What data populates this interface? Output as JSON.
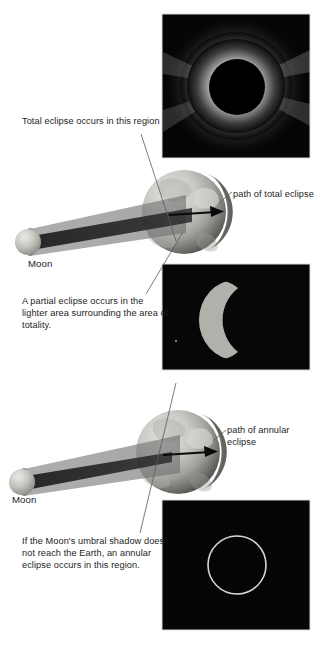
{
  "figure": {
    "background_color": "#ffffff",
    "text_color": "#1d1d1d",
    "width": 319,
    "height": 645
  },
  "captions": {
    "total_region": "Total eclipse occurs in this region",
    "partial_region": "A partial eclipse occurs in the lighter area surrounding the area of totality.",
    "annular_region": "If the Moon's umbral shadow does not reach the Earth, an annular eclipse occurs in this region.",
    "path_of_total": "path of total eclipse",
    "path_of_annular": "path of annular eclipse"
  },
  "labels": {
    "moon_top": "Moon",
    "moon_bottom": "Moon"
  },
  "photos": [
    {
      "name": "total-eclipse-corona-photo",
      "alt": "Total solar eclipse showing the white corona around a black lunar disk",
      "x": 162,
      "y": 14,
      "width": 148,
      "height": 144,
      "background_color": "#060606",
      "corona_color": "#f4f4f4",
      "disk_color": "#000000"
    },
    {
      "name": "partial-eclipse-photo",
      "alt": "Partial solar eclipse showing a bright crescent of the Sun",
      "x": 162,
      "y": 264,
      "width": 148,
      "height": 106,
      "background_color": "#070707",
      "crescent_color": "#b9b9b4"
    },
    {
      "name": "annular-eclipse-photo",
      "alt": "Annular solar eclipse showing a thin ring of fire",
      "x": 162,
      "y": 500,
      "width": 148,
      "height": 130,
      "background_color": "#050505",
      "ring_color": "#cfcfc8"
    }
  ],
  "diagrams": [
    {
      "name": "total-eclipse-diagram",
      "earth": {
        "cx": 184,
        "cy": 212,
        "r": 42
      },
      "moon": {
        "cx": 28,
        "cy": 242,
        "r": 13
      },
      "umbra_color": "#2b2b2b",
      "penumbra_color": "#9a9a9a",
      "arrow_label": "path of total eclipse",
      "shadow_reaches_earth": true
    },
    {
      "name": "annular-eclipse-diagram",
      "earth": {
        "cx": 178,
        "cy": 452,
        "r": 42
      },
      "moon": {
        "cx": 22,
        "cy": 482,
        "r": 13
      },
      "umbra_color": "#2b2b2b",
      "penumbra_color": "#9a9a9a",
      "arrow_label": "path of annular eclipse",
      "shadow_reaches_earth": false
    }
  ],
  "leader_lines": [
    {
      "name": "leader-total-region",
      "from": [
        141,
        134
      ],
      "to": [
        176,
        241
      ]
    },
    {
      "name": "leader-partial-region",
      "from": [
        183,
        232
      ],
      "to": [
        146,
        294
      ]
    },
    {
      "name": "leader-path-total",
      "from": [
        232,
        192
      ],
      "to": [
        220,
        202
      ]
    },
    {
      "name": "leader-annular-region",
      "from": [
        176,
        383
      ],
      "to": [
        140,
        533
      ]
    },
    {
      "name": "leader-path-annular",
      "from": [
        226,
        430
      ],
      "to": [
        214,
        440
      ]
    }
  ]
}
